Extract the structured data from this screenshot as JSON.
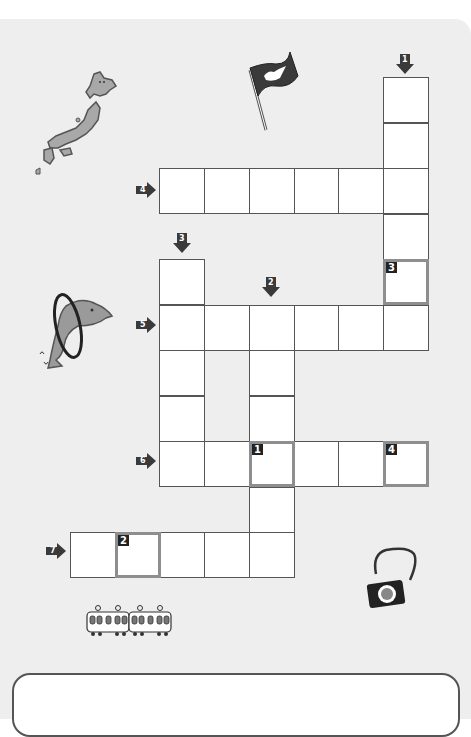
{
  "puzzle": {
    "type": "crossword",
    "cell_size": 44,
    "origin": {
      "x": 70,
      "y": 77
    },
    "clues": [
      {
        "number": "1",
        "direction": "down",
        "arrow": {
          "x": 396,
          "y": 54
        }
      },
      {
        "number": "2",
        "direction": "down",
        "arrow": {
          "x": 262,
          "y": 277
        }
      },
      {
        "number": "3",
        "direction": "down",
        "arrow": {
          "x": 173,
          "y": 233
        }
      },
      {
        "number": "4",
        "direction": "across",
        "arrow": {
          "x": 136,
          "y": 182
        }
      },
      {
        "number": "5",
        "direction": "across",
        "arrow": {
          "x": 136,
          "y": 317
        }
      },
      {
        "number": "6",
        "direction": "across",
        "arrow": {
          "x": 136,
          "y": 453
        }
      },
      {
        "number": "7",
        "direction": "across",
        "arrow": {
          "x": 46,
          "y": 543
        }
      }
    ],
    "highlighted_cells": [
      {
        "label": "1",
        "col": 4,
        "row": 8
      },
      {
        "label": "2",
        "col": 1,
        "row": 10
      },
      {
        "label": "3",
        "col": 7,
        "row": 4
      },
      {
        "label": "4",
        "col": 7,
        "row": 8
      }
    ],
    "cells": [
      [
        7,
        0
      ],
      [
        7,
        1
      ],
      [
        7,
        2
      ],
      [
        7,
        3
      ],
      [
        7,
        4
      ],
      [
        7,
        5
      ],
      [
        2,
        2
      ],
      [
        3,
        2
      ],
      [
        4,
        2
      ],
      [
        5,
        2
      ],
      [
        6,
        2
      ],
      [
        2,
        4
      ],
      [
        2,
        5
      ],
      [
        2,
        6
      ],
      [
        2,
        7
      ],
      [
        2,
        8
      ],
      [
        3,
        5
      ],
      [
        4,
        5
      ],
      [
        5,
        5
      ],
      [
        6,
        5
      ],
      [
        4,
        6
      ],
      [
        4,
        7
      ],
      [
        4,
        9
      ],
      [
        4,
        10
      ],
      [
        3,
        8
      ],
      [
        4,
        8
      ],
      [
        5,
        8
      ],
      [
        6,
        8
      ],
      [
        7,
        8
      ],
      [
        0,
        10
      ],
      [
        1,
        10
      ],
      [
        2,
        10
      ],
      [
        3,
        10
      ]
    ]
  },
  "illustrations": [
    {
      "name": "japan-map-icon",
      "x": 34,
      "y": 72
    },
    {
      "name": "flag-with-dove-icon",
      "x": 250,
      "y": 50
    },
    {
      "name": "dolphin-hoop-icon",
      "x": 38,
      "y": 288
    },
    {
      "name": "camera-icon",
      "x": 362,
      "y": 546
    },
    {
      "name": "train-icon",
      "x": 86,
      "y": 606
    }
  ],
  "colors": {
    "panel": "#eeeeee",
    "cell_border": "#555555",
    "highlight_border": "#8e8e8e",
    "arrow": "#3a3a3a"
  }
}
